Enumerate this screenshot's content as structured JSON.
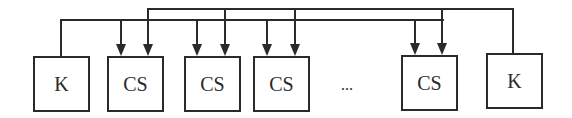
{
  "diagram": {
    "line_color": "#2a2a2a",
    "nodes": [
      {
        "id": "k-left",
        "label": "K",
        "x": 33,
        "y": 56,
        "w": 57,
        "h": 56
      },
      {
        "id": "cs-1",
        "label": "CS",
        "x": 107,
        "y": 56,
        "w": 57,
        "h": 56
      },
      {
        "id": "cs-2",
        "label": "CS",
        "x": 184,
        "y": 56,
        "w": 57,
        "h": 56
      },
      {
        "id": "cs-3",
        "label": "CS",
        "x": 253,
        "y": 56,
        "w": 57,
        "h": 56
      },
      {
        "id": "cs-4",
        "label": "CS",
        "x": 401,
        "y": 55,
        "w": 57,
        "h": 56
      },
      {
        "id": "k-right",
        "label": "K",
        "x": 486,
        "y": 53,
        "w": 57,
        "h": 56
      }
    ],
    "ellipsis": "...",
    "buses": [
      {
        "name": "lower-bus",
        "from": "k-left",
        "y": 20,
        "x_start": 61,
        "x_end": 444,
        "arrows_x": [
          121,
          197,
          267,
          415
        ]
      },
      {
        "name": "upper-bus",
        "from": "k-right",
        "y": 9,
        "x_start": 148,
        "x_end": 513,
        "arrows_x": [
          148,
          225,
          295,
          442
        ]
      }
    ]
  }
}
